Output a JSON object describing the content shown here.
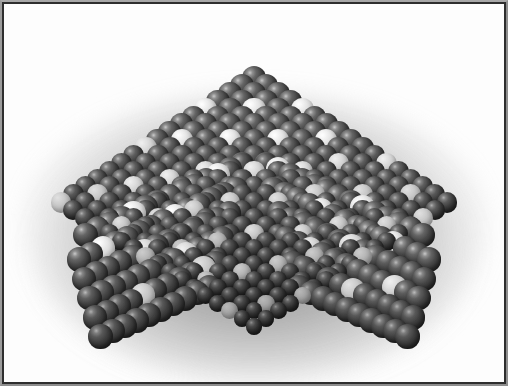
{
  "figure": {
    "view": "oblique top-down three-quarter view",
    "shape": "truncated pyramid with flat rhombic top face and two visible side facets",
    "background_color": "#fdfdfd",
    "frame_color": "#2e2e2e",
    "frame_bevel_color": "#a8a8a8",
    "halo_color": "#7a7a7a",
    "host_atom_color": "#3a3a3a",
    "host_atom_highlight": "#c9c9c9",
    "dopant_atom_color": "#ebebeb",
    "dopant_atom_highlight": "#ffffff",
    "canvas": {
      "width": 500,
      "height": 378,
      "offset_x": 4,
      "offset_y": 4
    }
  },
  "lattice": {
    "packing": "close-packed cubic",
    "top_face": {
      "rows_u": 17,
      "rows_v": 17,
      "origin_x": 250,
      "origin_y": 148,
      "u_dx": -12.05,
      "u_dy": 5.45,
      "v_dx": 12.05,
      "v_dy": 5.45,
      "depth_dx": 0.0,
      "depth_dy": -2.3,
      "radius_near": 12.2,
      "radius_far": 8.2
    },
    "left_face": {
      "columns": 14,
      "layers": 6,
      "origin_x": 238,
      "origin_y": 160,
      "col_dx": -12.05,
      "col_dy": 5.45,
      "layer_dx": -0.6,
      "layer_dy": 22.0,
      "radius": 12.2
    },
    "right_face": {
      "columns": 14,
      "layers": 6,
      "origin_x": 262,
      "origin_y": 160,
      "col_dx": 12.05,
      "col_dy": 5.45,
      "layer_dx": 0.6,
      "layer_dy": 22.0,
      "radius": 12.2
    },
    "dopant_fraction_top": 0.18,
    "dopant_fraction_side": 0.05
  },
  "dopant_sites_top": [
    [
      0,
      4
    ],
    [
      0,
      11
    ],
    [
      1,
      7
    ],
    [
      1,
      14
    ],
    [
      2,
      2
    ],
    [
      2,
      9
    ],
    [
      2,
      16
    ],
    [
      3,
      5
    ],
    [
      3,
      12
    ],
    [
      4,
      0
    ],
    [
      4,
      8
    ],
    [
      4,
      15
    ],
    [
      5,
      3
    ],
    [
      5,
      10
    ],
    [
      6,
      6
    ],
    [
      6,
      13
    ],
    [
      7,
      1
    ],
    [
      7,
      9
    ],
    [
      7,
      16
    ],
    [
      8,
      4
    ],
    [
      8,
      12
    ],
    [
      9,
      0
    ],
    [
      9,
      7
    ],
    [
      9,
      14
    ],
    [
      10,
      3
    ],
    [
      10,
      10
    ],
    [
      11,
      6
    ],
    [
      11,
      13
    ],
    [
      12,
      2
    ],
    [
      12,
      9
    ],
    [
      12,
      16
    ],
    [
      13,
      5
    ],
    [
      13,
      12
    ],
    [
      14,
      1
    ],
    [
      14,
      8
    ],
    [
      14,
      15
    ],
    [
      15,
      4
    ],
    [
      15,
      11
    ],
    [
      16,
      7
    ],
    [
      16,
      14
    ],
    [
      16,
      0
    ]
  ],
  "dopant_sites_left": [
    [
      2,
      0
    ],
    [
      5,
      1
    ],
    [
      9,
      0
    ],
    [
      3,
      3
    ],
    [
      7,
      2
    ],
    [
      11,
      1
    ],
    [
      1,
      4
    ],
    [
      6,
      4
    ],
    [
      12,
      3
    ]
  ],
  "dopant_sites_right": [
    [
      1,
      0
    ],
    [
      4,
      1
    ],
    [
      8,
      0
    ],
    [
      2,
      3
    ],
    [
      6,
      2
    ],
    [
      10,
      1
    ],
    [
      12,
      4
    ],
    [
      5,
      4
    ],
    [
      9,
      3
    ]
  ],
  "accessibility": {
    "alt_text": "Grayscale three-dimensional rendering of a crystalline nanoparticle built from close-packed spheres. Most spheres are dark gray; scattered lighter white spheres represent dopant or substitute atoms distributed across the flat top facet and the two sloping front facets. The particle is framed by a thin dark border and casts a soft diffuse shadow on a white background.",
    "caption": ""
  }
}
